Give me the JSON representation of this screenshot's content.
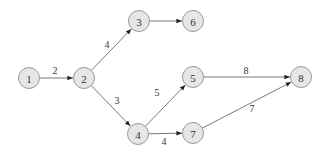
{
  "diagram": {
    "type": "directed-graph",
    "node_fill": "#e6e6e6",
    "node_stroke": "#9a9a9a",
    "edge_color": "#555555",
    "nodes": [
      {
        "id": "1",
        "label": "1",
        "x": 29,
        "y": 78
      },
      {
        "id": "2",
        "label": "2",
        "x": 84,
        "y": 78
      },
      {
        "id": "3",
        "label": "3",
        "x": 139,
        "y": 21
      },
      {
        "id": "6",
        "label": "6",
        "x": 193,
        "y": 21
      },
      {
        "id": "4",
        "label": "4",
        "x": 138,
        "y": 134
      },
      {
        "id": "5",
        "label": "5",
        "x": 193,
        "y": 77
      },
      {
        "id": "7",
        "label": "7",
        "x": 193,
        "y": 133
      },
      {
        "id": "8",
        "label": "8",
        "x": 301,
        "y": 77
      }
    ],
    "edges": [
      {
        "from": "1",
        "to": "2",
        "weight": "2",
        "lx": 55,
        "ly": 70
      },
      {
        "from": "2",
        "to": "3",
        "weight": "4",
        "lx": 107,
        "ly": 44
      },
      {
        "from": "3",
        "to": "6",
        "weight": "",
        "lx": 0,
        "ly": 0
      },
      {
        "from": "2",
        "to": "4",
        "weight": "3",
        "lx": 117,
        "ly": 100
      },
      {
        "from": "4",
        "to": "5",
        "weight": "5",
        "lx": 157,
        "ly": 92
      },
      {
        "from": "5",
        "to": "8",
        "weight": "8",
        "lx": 246,
        "ly": 70
      },
      {
        "from": "4",
        "to": "7",
        "weight": "4",
        "lx": 164,
        "ly": 141
      },
      {
        "from": "7",
        "to": "8",
        "weight": "7",
        "lx": 252,
        "ly": 108
      }
    ]
  }
}
